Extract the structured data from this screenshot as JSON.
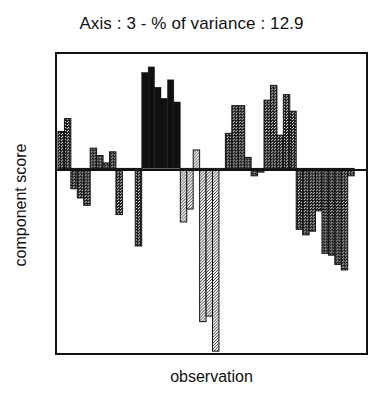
{
  "chart_data": {
    "type": "bar",
    "title": "Axis : 3 - % of variance : 12.9",
    "xlabel": "observation",
    "ylabel": "component score",
    "grid": false,
    "legend": false,
    "axis_number": 3,
    "percent_of_variance": 12.9,
    "ylim": [
      -1.0,
      0.62
    ],
    "zero_line": true,
    "bar_count": 46,
    "fill_patterns": [
      "solid-black",
      "dark-hatch",
      "light-dot"
    ],
    "categories": [
      "1",
      "2",
      "3",
      "4",
      "5",
      "6",
      "7",
      "8",
      "9",
      "10",
      "11",
      "12",
      "13",
      "14",
      "15",
      "16",
      "17",
      "18",
      "19",
      "20",
      "21",
      "22",
      "23",
      "24",
      "25",
      "26",
      "27",
      "28",
      "29",
      "30",
      "31",
      "32",
      "33",
      "34",
      "35",
      "36",
      "37",
      "38",
      "39",
      "40",
      "41",
      "42",
      "43",
      "44",
      "45",
      "46"
    ],
    "values": [
      0.2,
      0.27,
      -0.11,
      -0.16,
      -0.2,
      0.11,
      0.07,
      0.03,
      0.09,
      -0.25,
      -0.01,
      -0.01,
      -0.42,
      0.52,
      0.55,
      0.44,
      0.38,
      0.48,
      0.36,
      -0.29,
      -0.22,
      0.1,
      -0.83,
      -0.8,
      -0.99,
      -0.01,
      0.19,
      0.34,
      0.34,
      0.06,
      -0.04,
      -0.02,
      0.37,
      0.45,
      0.18,
      0.4,
      0.31,
      -0.33,
      -0.36,
      -0.34,
      -0.23,
      -0.46,
      -0.47,
      -0.52,
      -0.55,
      -0.04
    ],
    "fills": [
      "dark",
      "dark",
      "dark",
      "dark",
      "dark",
      "dark",
      "dark",
      "dark",
      "dark",
      "dark",
      "dark",
      "dark",
      "dark",
      "black",
      "black",
      "black",
      "black",
      "black",
      "black",
      "light",
      "light",
      "light",
      "light",
      "light",
      "light",
      "light",
      "dark",
      "dark",
      "dark",
      "dark",
      "dark",
      "dark",
      "dark",
      "dark",
      "dark",
      "dark",
      "dark",
      "dark",
      "dark",
      "dark",
      "dark",
      "dark",
      "dark",
      "dark",
      "dark",
      "dark"
    ]
  }
}
